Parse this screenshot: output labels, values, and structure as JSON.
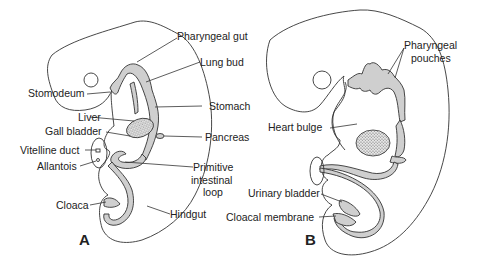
{
  "figure": {
    "panels": [
      {
        "id": "A",
        "label": "A",
        "labels": {
          "pharyngeal_gut": "Pharyngeal gut",
          "lung_bud": "Lung bud",
          "stomodeum": "Stomodeum",
          "stomach": "Stomach",
          "liver": "Liver",
          "gall_bladder": "Gall bladder",
          "pancreas": "Pancreas",
          "vitelline_duct": "Vitelline duct",
          "allantois": "Allantois",
          "primitive_intestinal_loop_1": "Primitive",
          "primitive_intestinal_loop_2": "intestinal",
          "primitive_intestinal_loop_3": "loop",
          "cloaca": "Cloaca",
          "hindgut": "Hindgut"
        }
      },
      {
        "id": "B",
        "label": "B",
        "labels": {
          "pharyngeal_pouches_1": "Pharyngeal",
          "pharyngeal_pouches_2": "pouches",
          "heart_bulge": "Heart bulge",
          "urinary_bladder": "Urinary bladder",
          "cloacal_membrane": "Cloacal membrane"
        }
      }
    ]
  }
}
